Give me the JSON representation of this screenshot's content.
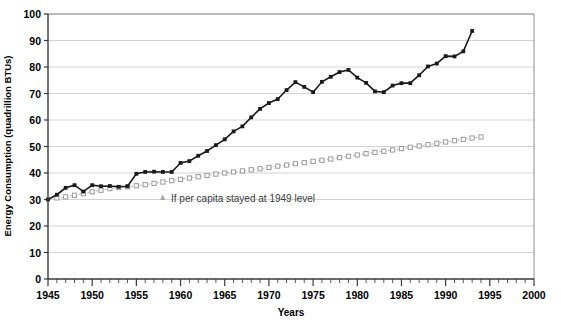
{
  "chart_data": {
    "type": "line",
    "title": "",
    "xlabel": "Years",
    "ylabel": "Energy Consumption (quadrillion BTUs)",
    "xlim": [
      1945,
      2000
    ],
    "ylim": [
      0,
      100
    ],
    "xticks": [
      1945,
      1950,
      1955,
      1960,
      1965,
      1970,
      1975,
      1980,
      1985,
      1990,
      1995,
      2000
    ],
    "yticks": [
      0,
      10,
      20,
      30,
      40,
      50,
      60,
      70,
      80,
      90,
      100
    ],
    "minor_x_tick_interval": 1,
    "grid": "horizontal",
    "legend_position": "inside-lower-center",
    "series": [
      {
        "name": "Actual energy consumption",
        "marker": "filled-square",
        "line_style": "solid",
        "color": "#1a1a1a",
        "x": [
          1945,
          1946,
          1947,
          1948,
          1949,
          1950,
          1951,
          1952,
          1953,
          1954,
          1955,
          1956,
          1957,
          1958,
          1959,
          1960,
          1961,
          1962,
          1963,
          1964,
          1965,
          1966,
          1967,
          1968,
          1969,
          1970,
          1971,
          1972,
          1973,
          1974,
          1975,
          1976,
          1977,
          1978,
          1979,
          1980,
          1981,
          1982,
          1983,
          1984,
          1985,
          1986,
          1987,
          1988,
          1989,
          1990,
          1991,
          1992,
          1993
        ],
        "values": [
          30.0,
          31.8,
          34.4,
          35.4,
          33.0,
          35.4,
          35.0,
          35.1,
          34.8,
          35.0,
          39.7,
          40.4,
          40.5,
          40.4,
          40.4,
          43.8,
          44.5,
          46.5,
          48.3,
          50.5,
          52.7,
          55.7,
          57.6,
          61.0,
          64.2,
          66.4,
          67.9,
          71.3,
          74.3,
          72.5,
          70.5,
          74.4,
          76.3,
          78.1,
          78.9,
          76.0,
          74.0,
          70.8,
          70.5,
          73.0,
          73.9,
          73.9,
          76.9,
          80.2,
          81.3,
          84.1,
          84.0,
          85.9,
          93.6
        ]
      },
      {
        "name": "If per capita stayed at 1949 level",
        "marker": "open-square",
        "line_style": "dashed",
        "color": "#b3b3b3",
        "x": [
          1946,
          1947,
          1948,
          1949,
          1950,
          1951,
          1952,
          1953,
          1954,
          1955,
          1956,
          1957,
          1958,
          1959,
          1960,
          1961,
          1962,
          1963,
          1964,
          1965,
          1966,
          1967,
          1968,
          1969,
          1970,
          1971,
          1972,
          1973,
          1974,
          1975,
          1976,
          1977,
          1978,
          1979,
          1980,
          1981,
          1982,
          1983,
          1984,
          1985,
          1986,
          1987,
          1988,
          1989,
          1990,
          1991,
          1992,
          1993,
          1994
        ],
        "values": [
          30.6,
          31.0,
          31.6,
          32.2,
          32.9,
          33.5,
          34.1,
          34.5,
          34.8,
          35.2,
          35.6,
          36.1,
          36.6,
          37.1,
          37.6,
          38.1,
          38.6,
          39.1,
          39.6,
          40.0,
          40.4,
          40.8,
          41.2,
          41.6,
          42.1,
          42.6,
          43.0,
          43.5,
          43.9,
          44.4,
          44.8,
          45.3,
          45.8,
          46.3,
          46.8,
          47.3,
          47.8,
          48.2,
          48.7,
          49.2,
          49.7,
          50.2,
          50.7,
          51.2,
          51.7,
          52.2,
          52.7,
          53.2,
          53.6
        ]
      }
    ],
    "legend": [
      {
        "label": "If per capita stayed at 1949 level",
        "marker": "triangle",
        "color": "#a8a8a8"
      }
    ]
  }
}
